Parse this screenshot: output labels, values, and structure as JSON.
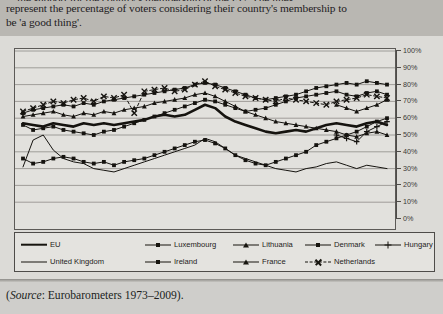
{
  "intro": {
    "line_clipped": "…the support for the country's membership of the EU. The lines",
    "line1": "represent the percentage of voters considering their country's membership to",
    "line2": "be 'a good thing'."
  },
  "source": {
    "prefix": "(",
    "italic_label": "Source",
    "rest": ": Eurobarometers 1973–2009)."
  },
  "legend": {
    "rows": [
      [
        {
          "label": "EU",
          "style": "thick",
          "marker": "none"
        },
        {
          "label": "Luxembourg",
          "style": "thin",
          "marker": "square"
        },
        {
          "label": "Lithuania",
          "style": "thin",
          "marker": "triangle"
        },
        {
          "label": "Denmark",
          "style": "thin",
          "marker": "square"
        },
        {
          "label": "Hungary",
          "style": "thin",
          "marker": "plus"
        }
      ],
      [
        {
          "label": "United Kingdom",
          "style": "thin",
          "marker": "none"
        },
        {
          "label": "Ireland",
          "style": "thin",
          "marker": "square"
        },
        {
          "label": "France",
          "style": "thin",
          "marker": "triangle"
        },
        {
          "label": "Netherlands",
          "style": "dashed",
          "marker": "cross"
        }
      ]
    ]
  },
  "chart_data": {
    "type": "line",
    "title": "",
    "xlabel": "",
    "ylabel": "",
    "ylim": [
      0,
      100
    ],
    "xlim": [
      1973,
      2009
    ],
    "grid": true,
    "legend_position": "below",
    "ytick_labels": [
      "100%",
      "90%",
      "80%",
      "70%",
      "60%",
      "50%",
      "40%",
      "30%",
      "20%",
      "10%",
      "0%"
    ],
    "ytick_values": [
      100,
      90,
      80,
      70,
      60,
      50,
      40,
      30,
      20,
      10,
      0
    ],
    "xtick_labels": [
      "1973",
      "1975",
      "1977",
      "1979",
      "1981",
      "1983",
      "1985",
      "1987",
      "1989",
      "1991",
      "1993",
      "1995",
      "1997",
      "1999",
      "2001",
      "2003",
      "2005",
      "2007",
      "2009"
    ],
    "x": [
      1973,
      1974,
      1975,
      1976,
      1977,
      1978,
      1979,
      1980,
      1981,
      1982,
      1983,
      1984,
      1985,
      1986,
      1987,
      1988,
      1989,
      1990,
      1991,
      1992,
      1993,
      1994,
      1995,
      1996,
      1997,
      1998,
      1999,
      2000,
      2001,
      2002,
      2003,
      2004,
      2005,
      2006,
      2007,
      2008,
      2009
    ],
    "series": [
      {
        "name": "EU",
        "style": "thick",
        "marker": "none",
        "values": [
          57,
          56,
          55,
          57,
          56,
          55,
          57,
          56,
          57,
          56,
          57,
          58,
          59,
          61,
          62,
          61,
          62,
          65,
          68,
          66,
          61,
          58,
          56,
          54,
          52,
          51,
          52,
          53,
          52,
          54,
          56,
          57,
          56,
          55,
          57,
          58,
          56
        ]
      },
      {
        "name": "Luxembourg",
        "style": "thin",
        "marker": "square",
        "values": [
          63,
          65,
          66,
          67,
          68,
          67,
          69,
          68,
          70,
          71,
          72,
          73,
          74,
          75,
          76,
          77,
          78,
          80,
          81,
          80,
          78,
          76,
          74,
          72,
          71,
          72,
          73,
          74,
          76,
          78,
          79,
          80,
          81,
          80,
          82,
          81,
          80
        ]
      },
      {
        "name": "Lithuania",
        "style": "thin",
        "marker": "triangle",
        "values": [
          null,
          null,
          null,
          null,
          null,
          null,
          null,
          null,
          null,
          null,
          null,
          null,
          null,
          null,
          null,
          null,
          null,
          null,
          null,
          null,
          null,
          null,
          null,
          null,
          null,
          null,
          null,
          null,
          null,
          null,
          null,
          68,
          66,
          64,
          66,
          68,
          71
        ]
      },
      {
        "name": "Denmark",
        "style": "thin",
        "marker": "square",
        "values": [
          36,
          33,
          34,
          36,
          37,
          36,
          34,
          33,
          34,
          32,
          34,
          35,
          36,
          38,
          40,
          42,
          44,
          46,
          47,
          45,
          42,
          38,
          35,
          33,
          32,
          34,
          36,
          38,
          40,
          44,
          46,
          48,
          50,
          52,
          55,
          58,
          60
        ]
      },
      {
        "name": "Hungary",
        "style": "thin",
        "marker": "plus",
        "values": [
          null,
          null,
          null,
          null,
          null,
          null,
          null,
          null,
          null,
          null,
          null,
          null,
          null,
          null,
          null,
          null,
          null,
          null,
          null,
          null,
          null,
          null,
          null,
          null,
          null,
          null,
          null,
          null,
          null,
          null,
          null,
          50,
          48,
          46,
          52,
          55,
          58
        ]
      },
      {
        "name": "United Kingdom",
        "style": "thin",
        "marker": "none",
        "values": [
          31,
          47,
          50,
          41,
          36,
          34,
          33,
          30,
          29,
          28,
          30,
          32,
          34,
          36,
          38,
          40,
          42,
          44,
          48,
          46,
          42,
          38,
          36,
          34,
          32,
          30,
          29,
          28,
          30,
          31,
          33,
          34,
          32,
          30,
          32,
          31,
          30
        ]
      },
      {
        "name": "Ireland",
        "style": "thin",
        "marker": "square",
        "values": [
          56,
          53,
          54,
          55,
          53,
          52,
          51,
          50,
          52,
          53,
          55,
          57,
          59,
          61,
          63,
          65,
          67,
          69,
          71,
          70,
          68,
          66,
          64,
          65,
          66,
          68,
          70,
          72,
          73,
          74,
          75,
          76,
          74,
          73,
          75,
          76,
          74
        ]
      },
      {
        "name": "France",
        "style": "thin",
        "marker": "triangle",
        "values": [
          61,
          62,
          63,
          64,
          62,
          61,
          63,
          62,
          64,
          63,
          65,
          66,
          67,
          69,
          70,
          71,
          72,
          74,
          75,
          73,
          70,
          67,
          64,
          62,
          60,
          58,
          57,
          56,
          55,
          54,
          53,
          52,
          50,
          49,
          51,
          52,
          50
        ]
      },
      {
        "name": "Netherlands",
        "style": "dashed",
        "marker": "cross",
        "values": [
          64,
          66,
          68,
          70,
          69,
          71,
          72,
          70,
          73,
          72,
          74,
          63,
          76,
          77,
          78,
          76,
          77,
          80,
          82,
          79,
          77,
          75,
          73,
          72,
          71,
          70,
          72,
          71,
          70,
          69,
          68,
          70,
          71,
          72,
          74,
          73,
          72
        ]
      }
    ]
  }
}
